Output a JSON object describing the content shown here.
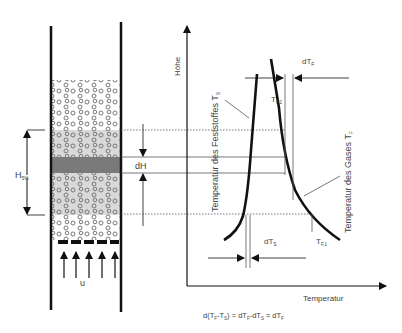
{
  "diagram": {
    "axes": {
      "y_label": "Höhe",
      "x_label": "Temperatur"
    },
    "column": {
      "height_label": "H",
      "height_sub": "5%",
      "slice_label": "dH",
      "flow_label": "u",
      "flow_arrow_count": 5,
      "distributor_segments": 5
    },
    "curves": {
      "solid": {
        "label": "Temperatur des Feststoffes T",
        "sub": "S"
      },
      "gas": {
        "label": "Temperatur des Gases T",
        "sub": "F"
      }
    },
    "annotations": {
      "dTF": "dT",
      "dTF_sub": "F",
      "dTS": "dT",
      "dTS_sub": "S",
      "TF2": "T",
      "TF2_sub": "F,2",
      "TF1": "T",
      "TF1_sub": "F,1"
    },
    "equation": "d(T_F-T_S) = dT_F-dT_S ≈ dT_F",
    "colors": {
      "line": "#111111",
      "zone_light": "#d9d9d9",
      "zone_dark": "#7a7a7a",
      "particle": "#888888"
    }
  }
}
